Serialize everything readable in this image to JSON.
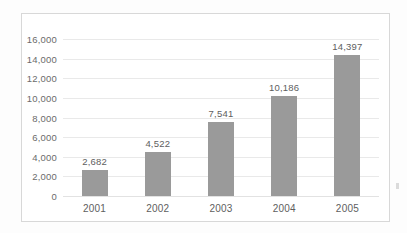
{
  "chart_data": {
    "type": "bar",
    "title": "",
    "subtitle": "",
    "xlabel": "",
    "ylabel": "",
    "categories": [
      "2001",
      "2002",
      "2003",
      "2004",
      "2005"
    ],
    "values": [
      2682,
      4522,
      7541,
      10186,
      14397
    ],
    "value_labels": [
      "2,682",
      "4,522",
      "7,541",
      "10,186",
      "14,397"
    ],
    "ylim": [
      0,
      16000
    ],
    "ytick_step": 2000,
    "ytick_labels": [
      "16,000",
      "14,000",
      "12,000",
      "10,000",
      "8,000",
      "6,000",
      "4,000",
      "2,000",
      "0"
    ],
    "ytick_values": [
      16000,
      14000,
      12000,
      10000,
      8000,
      6000,
      4000,
      2000,
      0
    ],
    "grid": true,
    "legend": null,
    "legend_position": "none",
    "series": [
      {
        "name": "",
        "values": [
          2682,
          4522,
          7541,
          10186,
          14397
        ]
      }
    ],
    "bar_color": "#9a9a9a",
    "gridline_color": "#e9e9e9",
    "axis_text_color": "#5e5e5e",
    "plot_background": "#ffffff",
    "frame_color": "#d8d8d8"
  }
}
